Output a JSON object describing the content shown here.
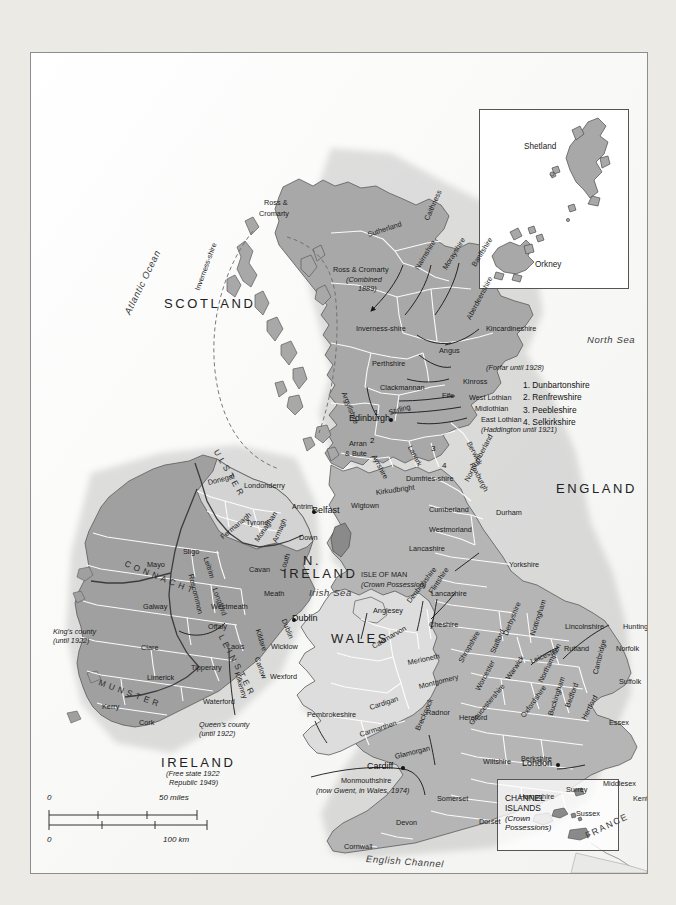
{
  "title": {
    "line1": "THE BRITISH ISLES IN 1965",
    "line2": "(showing all the county boundaries before changes made in 1974)"
  },
  "legend": {
    "items": [
      {
        "label": "Scotland",
        "note": "(in 1909)",
        "color": "#a8a8a8"
      },
      {
        "label": "England",
        "note": "(in 1834)",
        "color": "#b5b5b5"
      },
      {
        "label": "Wales",
        "note": "(in 1834)",
        "color": "#dddddd"
      },
      {
        "label": "Northern Ireland",
        "note": "(since 1922)",
        "color": "#d3d3d3"
      },
      {
        "label": "Republic of Ireland",
        "note": "(since 1949)",
        "color": "#a0a0a0"
      },
      {
        "label": "Isle of Man and",
        "label2": "Channel Islands",
        "note": "",
        "color": "#8a8a8a"
      }
    ]
  },
  "note_box": {
    "lines": [
      "Ireland was partitioned in 1922.",
      "Three of the counties of Ulster opted",
      "to join the Irish Free State (which",
      "became a republic in 1949)."
    ]
  },
  "insets": {
    "shetland": {
      "labels": [
        "Shetland",
        "Orkney"
      ]
    },
    "channel_islands": {
      "title1": "CHANNEL",
      "title2": "ISLANDS",
      "sub1": "(Crown",
      "sub2": "Possessions)"
    }
  },
  "countries": [
    {
      "name": "SCOTLAND",
      "x": 133,
      "y": 243
    },
    {
      "name": "ENGLAND",
      "x": 525,
      "y": 428
    },
    {
      "name": "WALES",
      "x": 300,
      "y": 578
    },
    {
      "name": "N.",
      "x": 272,
      "y": 500
    },
    {
      "name": "IRELAND",
      "x": 252,
      "y": 513
    },
    {
      "name": "IRELAND",
      "x": 130,
      "y": 702
    }
  ],
  "country_caps": [
    {
      "text": "(Free state 1922",
      "x": 135,
      "y": 717
    },
    {
      "text": "Republic 1949)",
      "x": 138,
      "y": 726
    }
  ],
  "seas": [
    {
      "name": "Atlantic Ocean",
      "x": 96,
      "y": 255,
      "rot": -64
    },
    {
      "name": "North Sea",
      "x": 556,
      "y": 281,
      "rot": 0
    },
    {
      "name": "Irish Sea",
      "x": 278,
      "y": 534,
      "rot": 0
    },
    {
      "name": "English Channel",
      "x": 335,
      "y": 800,
      "rot": 4
    }
  ],
  "provinces": [
    {
      "name": "ULSTER",
      "x": 185,
      "y": 392,
      "rot": 60
    },
    {
      "name": "CONNACHT",
      "x": 94,
      "y": 505,
      "rot": 22
    },
    {
      "name": "LEINSTER",
      "x": 190,
      "y": 577,
      "rot": 62
    },
    {
      "name": "MUNSTER",
      "x": 68,
      "y": 624,
      "rot": 20
    }
  ],
  "cities": [
    {
      "name": "Edinburgh",
      "x": 358,
      "y": 365,
      "dx": 40,
      "dy": 4
    },
    {
      "name": "Belfast",
      "x": 281,
      "y": 457,
      "dx": -4,
      "dy": 4
    },
    {
      "name": "Dublin",
      "x": 261,
      "y": 565,
      "dx": -4,
      "dy": 4
    },
    {
      "name": "Cardiff",
      "x": 370,
      "y": 713,
      "dx": 34,
      "dy": 4
    },
    {
      "name": "London",
      "x": 525,
      "y": 710,
      "dx": 34,
      "dy": 4
    }
  ],
  "scotland_counties": [
    {
      "name": "Ross &",
      "x": 233,
      "y": 146,
      "rot": 0
    },
    {
      "name": "Cromarty",
      "x": 228,
      "y": 157,
      "rot": 0
    },
    {
      "name": "Sutherland",
      "x": 337,
      "y": 178,
      "rot": -18
    },
    {
      "name": "Caithness",
      "x": 396,
      "y": 163,
      "rot": -66
    },
    {
      "name": "Ross & Cromarty",
      "x": 302,
      "y": 213,
      "rot": 0
    },
    {
      "name": "(Combined",
      "x": 315,
      "y": 223,
      "rot": 0,
      "italic": true
    },
    {
      "name": "1889)",
      "x": 327,
      "y": 232,
      "rot": 0,
      "italic": true
    },
    {
      "name": "Nairnshire",
      "x": 386,
      "y": 212,
      "rot": -58
    },
    {
      "name": "Morayshire",
      "x": 414,
      "y": 212,
      "rot": -58
    },
    {
      "name": "Banffshire",
      "x": 443,
      "y": 209,
      "rot": -58
    },
    {
      "name": "Inverness-shire",
      "x": 325,
      "y": 272,
      "rot": 0
    },
    {
      "name": "Aberdeenshire",
      "x": 438,
      "y": 262,
      "rot": -62
    },
    {
      "name": "Inverness-shire",
      "x": 167,
      "y": 233,
      "rot": -70
    },
    {
      "name": "Perthshire",
      "x": 341,
      "y": 307,
      "rot": 0
    },
    {
      "name": "Angus",
      "x": 408,
      "y": 294,
      "rot": 0
    },
    {
      "name": "Kincardineshire",
      "x": 455,
      "y": 272,
      "rot": 0
    },
    {
      "name": "(Forfar until 1928)",
      "x": 455,
      "y": 311,
      "rot": 0,
      "italic": true
    },
    {
      "name": "Kinross",
      "x": 432,
      "y": 325,
      "rot": 0
    },
    {
      "name": "Clackmannan",
      "x": 349,
      "y": 331,
      "rot": 0
    },
    {
      "name": "Fife",
      "x": 411,
      "y": 339,
      "rot": 0
    },
    {
      "name": "West Lothian",
      "x": 438,
      "y": 341,
      "rot": 0
    },
    {
      "name": "Midlothian",
      "x": 444,
      "y": 352,
      "rot": 0
    },
    {
      "name": "East Lothian",
      "x": 450,
      "y": 363,
      "rot": 0
    },
    {
      "name": "(Haddington until 1921)",
      "x": 450,
      "y": 373,
      "rot": 0,
      "italic": true
    },
    {
      "name": "Stirling",
      "x": 358,
      "y": 356,
      "rot": -16
    },
    {
      "name": "Argyllshire",
      "x": 312,
      "y": 335,
      "rot": 68
    },
    {
      "name": "Arran",
      "x": 318,
      "y": 387,
      "rot": 0
    },
    {
      "name": "& Bute",
      "x": 314,
      "y": 397,
      "rot": 0
    },
    {
      "name": "Ayrshire",
      "x": 342,
      "y": 398,
      "rot": 62
    },
    {
      "name": "Lanark",
      "x": 378,
      "y": 389,
      "rot": 62
    },
    {
      "name": "Berwick",
      "x": 437,
      "y": 385,
      "rot": 62
    },
    {
      "name": "Roxburgh",
      "x": 440,
      "y": 406,
      "rot": 62
    },
    {
      "name": "Dumfries-shire",
      "x": 375,
      "y": 422,
      "rot": 0
    },
    {
      "name": "Kirkudbright",
      "x": 345,
      "y": 436,
      "rot": -8
    },
    {
      "name": "Wigtown",
      "x": 320,
      "y": 449,
      "rot": 0
    }
  ],
  "scotland_numbered": [
    {
      "n": "1",
      "label": "Dunbartonshire"
    },
    {
      "n": "2",
      "label": "Renfrewshire"
    },
    {
      "n": "3",
      "label": "Peebleshire"
    },
    {
      "n": "4",
      "label": "Selkirkshire"
    }
  ],
  "map_numbers": [
    {
      "n": "1",
      "x": 343,
      "y": 355
    },
    {
      "n": "2",
      "x": 339,
      "y": 383
    },
    {
      "n": "3",
      "x": 400,
      "y": 391
    },
    {
      "n": "4",
      "x": 411,
      "y": 408
    }
  ],
  "ireland_counties": [
    {
      "name": "Donegal",
      "x": 177,
      "y": 426,
      "rot": -14
    },
    {
      "name": "Londonderry",
      "x": 213,
      "y": 429,
      "rot": 0
    },
    {
      "name": "Antrim",
      "x": 261,
      "y": 450,
      "rot": 0
    },
    {
      "name": "Tyrone",
      "x": 215,
      "y": 466,
      "rot": 0
    },
    {
      "name": "Fermanagh",
      "x": 191,
      "y": 481,
      "rot": -40
    },
    {
      "name": "Armagh",
      "x": 244,
      "y": 485,
      "rot": -66
    },
    {
      "name": "Monaghan",
      "x": 226,
      "y": 484,
      "rot": -56
    },
    {
      "name": "Down",
      "x": 268,
      "y": 481,
      "rot": 0
    },
    {
      "name": "Sligo",
      "x": 152,
      "y": 495,
      "rot": 0
    },
    {
      "name": "Mayo",
      "x": 116,
      "y": 508,
      "rot": 0
    },
    {
      "name": "Leitrim",
      "x": 174,
      "y": 500,
      "rot": 72
    },
    {
      "name": "Roscommon",
      "x": 159,
      "y": 517,
      "rot": 76
    },
    {
      "name": "Cavan",
      "x": 218,
      "y": 513,
      "rot": 0
    },
    {
      "name": "Louth",
      "x": 252,
      "y": 514,
      "rot": -72
    },
    {
      "name": "Longford",
      "x": 183,
      "y": 531,
      "rot": 70
    },
    {
      "name": "Meath",
      "x": 233,
      "y": 537,
      "rot": 0
    },
    {
      "name": "Westmeath",
      "x": 180,
      "y": 550,
      "rot": 0
    },
    {
      "name": "Galway",
      "x": 112,
      "y": 550,
      "rot": 0
    },
    {
      "name": "Offaly",
      "x": 177,
      "y": 570,
      "rot": 0
    },
    {
      "name": "Kildare",
      "x": 226,
      "y": 572,
      "rot": 72
    },
    {
      "name": "Dublin",
      "x": 252,
      "y": 562,
      "rot": 68
    },
    {
      "name": "Wicklow",
      "x": 240,
      "y": 590,
      "rot": 0
    },
    {
      "name": "Laois",
      "x": 196,
      "y": 590,
      "rot": 0
    },
    {
      "name": "Carlow",
      "x": 225,
      "y": 600,
      "rot": 70
    },
    {
      "name": "Kilkenny",
      "x": 205,
      "y": 615,
      "rot": 72
    },
    {
      "name": "Clare",
      "x": 110,
      "y": 591,
      "rot": 0
    },
    {
      "name": "Tipperary",
      "x": 160,
      "y": 611,
      "rot": 0
    },
    {
      "name": "Limerick",
      "x": 116,
      "y": 621,
      "rot": 0
    },
    {
      "name": "Wexford",
      "x": 239,
      "y": 620,
      "rot": 0
    },
    {
      "name": "Waterford",
      "x": 172,
      "y": 645,
      "rot": 0
    },
    {
      "name": "Kerry",
      "x": 71,
      "y": 650,
      "rot": 0
    },
    {
      "name": "Cork",
      "x": 108,
      "y": 666,
      "rot": 0
    }
  ],
  "ireland_callouts": [
    {
      "l1": "King's county",
      "l2": "(until 1922)",
      "x": 22,
      "y": 575
    },
    {
      "l1": "Queen's county",
      "l2": "(until 1922)",
      "x": 168,
      "y": 668
    }
  ],
  "england_counties": [
    {
      "name": "Northumberland",
      "x": 436,
      "y": 424,
      "rot": -62
    },
    {
      "name": "Cumberland",
      "x": 398,
      "y": 453,
      "rot": 0
    },
    {
      "name": "Durham",
      "x": 465,
      "y": 456,
      "rot": 0
    },
    {
      "name": "Westmorland",
      "x": 398,
      "y": 473,
      "rot": 0
    },
    {
      "name": "Yorkshire",
      "x": 478,
      "y": 508,
      "rot": 0
    },
    {
      "name": "Lancashire",
      "x": 378,
      "y": 492,
      "rot": 0
    },
    {
      "name": "Lancashire",
      "x": 400,
      "y": 537,
      "rot": 0
    },
    {
      "name": "Cheshire",
      "x": 398,
      "y": 568,
      "rot": 0
    },
    {
      "name": "Derbyshire",
      "x": 475,
      "y": 578,
      "rot": -68
    },
    {
      "name": "Nottingham",
      "x": 502,
      "y": 578,
      "rot": -72
    },
    {
      "name": "Lincolnshire",
      "x": 534,
      "y": 570,
      "rot": 0
    },
    {
      "name": "Huntingdonshire",
      "x": 592,
      "y": 570,
      "rot": 0
    },
    {
      "name": "Rutland",
      "x": 533,
      "y": 592,
      "rot": 0
    },
    {
      "name": "Norfolk",
      "x": 585,
      "y": 592,
      "rot": 0
    },
    {
      "name": "Leicester",
      "x": 500,
      "y": 605,
      "rot": -24
    },
    {
      "name": "Stafford",
      "x": 462,
      "y": 596,
      "rot": -66
    },
    {
      "name": "Warwick",
      "x": 477,
      "y": 622,
      "rot": -56
    },
    {
      "name": "Northampton",
      "x": 510,
      "y": 625,
      "rot": -64
    },
    {
      "name": "Cambridge",
      "x": 565,
      "y": 617,
      "rot": -76
    },
    {
      "name": "Suffolk",
      "x": 588,
      "y": 625,
      "rot": 0
    },
    {
      "name": "Worcester",
      "x": 447,
      "y": 633,
      "rot": -62
    },
    {
      "name": "Bedford",
      "x": 537,
      "y": 650,
      "rot": -70
    },
    {
      "name": "Buckingham",
      "x": 520,
      "y": 658,
      "rot": -72
    },
    {
      "name": "Hertford",
      "x": 553,
      "y": 662,
      "rot": -62
    },
    {
      "name": "Oxfordshire",
      "x": 492,
      "y": 660,
      "rot": -54
    },
    {
      "name": "Gloucestershire",
      "x": 440,
      "y": 667,
      "rot": -50
    },
    {
      "name": "Essex",
      "x": 578,
      "y": 666,
      "rot": 0
    },
    {
      "name": "Berkshire",
      "x": 490,
      "y": 702,
      "rot": 0
    },
    {
      "name": "Wiltshire",
      "x": 452,
      "y": 705,
      "rot": 0
    },
    {
      "name": "Middlesex",
      "x": 572,
      "y": 727,
      "rot": 0
    },
    {
      "name": "Surrey",
      "x": 535,
      "y": 733,
      "rot": 0
    },
    {
      "name": "Kent",
      "x": 602,
      "y": 742,
      "rot": 0
    },
    {
      "name": "Hampshire",
      "x": 488,
      "y": 740,
      "rot": 0
    },
    {
      "name": "Sussex",
      "x": 545,
      "y": 757,
      "rot": 0
    },
    {
      "name": "Somerset",
      "x": 406,
      "y": 742,
      "rot": 0
    },
    {
      "name": "Dorset",
      "x": 448,
      "y": 765,
      "rot": 0
    },
    {
      "name": "Devon",
      "x": 365,
      "y": 766,
      "rot": 0
    },
    {
      "name": "Cornwall",
      "x": 313,
      "y": 790,
      "rot": 0
    },
    {
      "name": "Shropshire",
      "x": 430,
      "y": 605,
      "rot": -60
    }
  ],
  "wales_counties": [
    {
      "name": "Anglesey",
      "x": 342,
      "y": 554,
      "rot": 0
    },
    {
      "name": "Caernarvon",
      "x": 342,
      "y": 590,
      "rot": -30
    },
    {
      "name": "Denbighshire",
      "x": 378,
      "y": 545,
      "rot": -52
    },
    {
      "name": "Flintshire",
      "x": 400,
      "y": 536,
      "rot": -56
    },
    {
      "name": "Merioneth",
      "x": 377,
      "y": 606,
      "rot": -12
    },
    {
      "name": "Montgomery",
      "x": 388,
      "y": 630,
      "rot": -14
    },
    {
      "name": "Radnor",
      "x": 395,
      "y": 656,
      "rot": 0
    },
    {
      "name": "Cardigan",
      "x": 339,
      "y": 651,
      "rot": -18
    },
    {
      "name": "Pembrokeshire",
      "x": 276,
      "y": 658,
      "rot": 0
    },
    {
      "name": "Carmarthen",
      "x": 329,
      "y": 678,
      "rot": -18
    },
    {
      "name": "Brecknock",
      "x": 387,
      "y": 673,
      "rot": -66
    },
    {
      "name": "Glamorgan",
      "x": 364,
      "y": 700,
      "rot": -14
    },
    {
      "name": "Hereford",
      "x": 428,
      "y": 661,
      "rot": 0
    },
    {
      "name": "Monmouthshire",
      "x": 310,
      "y": 724,
      "rot": 0
    },
    {
      "name": "(now Gwent, in Wales, 1974)",
      "x": 285,
      "y": 734,
      "rot": 0,
      "italic": true
    }
  ],
  "isle_of_man": {
    "l1": "ISLE OF MAN",
    "l2": "(Crown Possession)",
    "x": 330,
    "y": 518
  },
  "other_labels": [
    {
      "name": "Isles of Scilly",
      "x": 186,
      "y": 829
    },
    {
      "name": "FRANCE",
      "x": 615,
      "y": 848
    }
  ],
  "scale": {
    "miles_zero": "0",
    "miles_max": "50 miles",
    "km_zero": "0",
    "km_max": "100 km"
  }
}
